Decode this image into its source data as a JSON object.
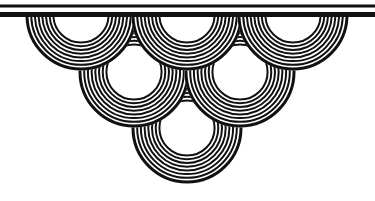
{
  "image": {
    "width": 375,
    "height": 201,
    "background": "#ffffff",
    "ink": "#111111",
    "description": "Decorative scallop / wave ornament of concentric ring fans hanging from horizontal rules"
  },
  "rules": [
    {
      "name": "thin-rule",
      "y": 6,
      "thickness": 3
    },
    {
      "name": "thick-rule",
      "y": 14.5,
      "thickness": 5
    }
  ],
  "ring_style": {
    "outer_radius": 54,
    "ring_count": 8,
    "ring_step": 3.7,
    "stroke_width": 2,
    "outer_stroke_width": 3
  },
  "fans": [
    {
      "row": 3,
      "cx": 187,
      "cy": 128
    },
    {
      "row": 2,
      "cx": 134,
      "cy": 72
    },
    {
      "row": 2,
      "cx": 240,
      "cy": 72
    },
    {
      "row": 1,
      "cx": 81,
      "cy": 15
    },
    {
      "row": 1,
      "cx": 187,
      "cy": 15
    },
    {
      "row": 1,
      "cx": 293,
      "cy": 15
    }
  ]
}
